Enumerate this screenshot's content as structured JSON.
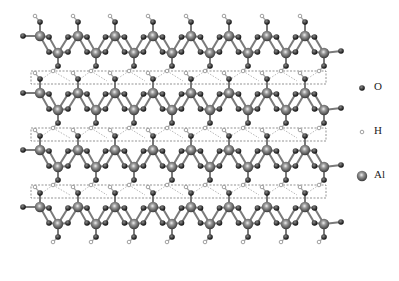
{
  "diagram": {
    "type": "crystal-structure",
    "layers": 4,
    "layer_y": [
      36,
      93,
      150,
      207
    ],
    "layer_offset": 17,
    "al_top_x": [
      40,
      78,
      115,
      153,
      191,
      229,
      267,
      305
    ],
    "al_bottom_x": [
      58,
      96,
      134,
      172,
      210,
      248,
      286,
      324
    ],
    "interlayer_boxes": [
      {
        "x": 31,
        "y": 71,
        "w": 295,
        "h": 13
      },
      {
        "x": 31,
        "y": 128,
        "w": 295,
        "h": 13
      },
      {
        "x": 31,
        "y": 185,
        "w": 295,
        "h": 13
      }
    ]
  },
  "legend": {
    "items": [
      {
        "label": "O",
        "symbol": "oxygen",
        "y": 88
      },
      {
        "label": "H",
        "symbol": "hydrogen",
        "y": 132
      },
      {
        "label": "Al",
        "symbol": "aluminum",
        "y": 176
      }
    ]
  },
  "colors": {
    "al": "#6a6a6a",
    "o": "#2a2a2a",
    "h": "#d8d8d8",
    "bond": "#7a7a7a",
    "hbond": "#999999"
  }
}
